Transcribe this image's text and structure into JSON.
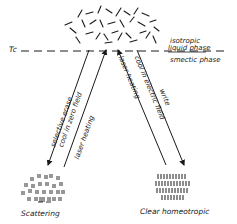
{
  "diagram": {
    "type": "state-transition",
    "colors": {
      "ink": "#1a1a1a",
      "background": "#ffffff"
    },
    "threshold": {
      "label": "Tc",
      "style": "dashed"
    },
    "phases": {
      "above": [
        "isotropic",
        "liquid phase"
      ],
      "below": "smectic phase"
    },
    "nodes": {
      "top": {
        "name": "isotropic-liquid",
        "icon": "random-rods-icon"
      },
      "left": {
        "name": "scattering",
        "label": "Scattering",
        "icon": "scattering-focal-conic-icon"
      },
      "right": {
        "name": "clear-homeotropic",
        "label": "Clear homeotropic",
        "icon": "aligned-rods-icon"
      }
    },
    "arrows": {
      "left_down": {
        "lines": [
          "selective erase",
          "cool in zero field"
        ]
      },
      "left_up": {
        "lines": [
          "laser heating"
        ]
      },
      "right_up": {
        "lines": [
          "laser heating"
        ]
      },
      "right_down": {
        "lines": [
          "write",
          "cool in electric field"
        ]
      }
    }
  }
}
